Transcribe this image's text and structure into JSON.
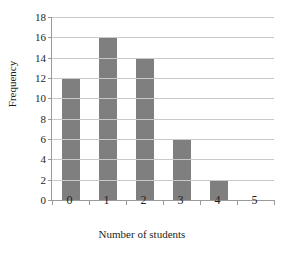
{
  "chart_data": {
    "type": "bar",
    "title": "in 50 households",
    "title_note": "clipped-at-top-edge",
    "categories": [
      "0",
      "1",
      "2",
      "3",
      "4",
      "5"
    ],
    "values": [
      12,
      16,
      14,
      6,
      2,
      0
    ],
    "xlabel": "Number of students",
    "ylabel": "Frequency",
    "ylim": [
      0,
      18
    ],
    "ytick_step": 2,
    "yticks": [
      "18",
      "16",
      "14",
      "12",
      "10",
      "8",
      "6",
      "4",
      "2",
      "0"
    ],
    "ytick_values": [
      18,
      16,
      14,
      12,
      10,
      8,
      6,
      4,
      2,
      0
    ],
    "grid": true,
    "legend": false,
    "bar_color": "#7f7f7f",
    "gridline_color": "#c9c9c9",
    "axis_color": "#9a9a9a",
    "background_color": "#ffffff"
  }
}
